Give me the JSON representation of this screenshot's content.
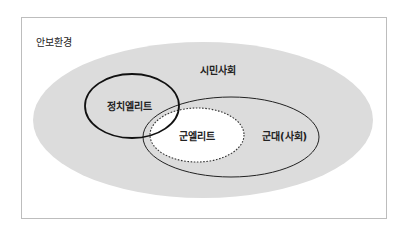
{
  "diagram": {
    "title": "안보환경",
    "colors": {
      "frame_border": "#bdbdbd",
      "civil_society_fill": "#dcdcdc",
      "military_elite_fill": "#ffffff",
      "stroke": "#222222"
    },
    "regions": {
      "civil_society": {
        "label": "시민사회"
      },
      "political_elite": {
        "label": "정치엘리트"
      },
      "military_society": {
        "label": "군대(사회)"
      },
      "military_elite": {
        "label": "군엘리트"
      }
    }
  }
}
